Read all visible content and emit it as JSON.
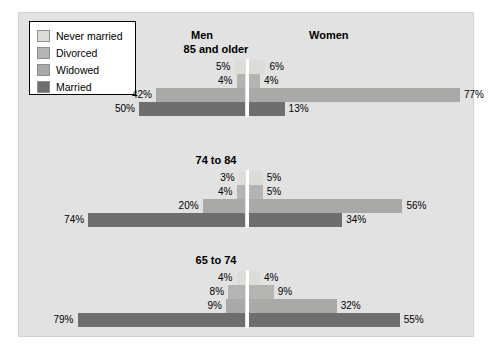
{
  "chart_data": {
    "type": "bar",
    "subtype": "diverging-horizontal-population-pyramid",
    "title": "",
    "xlabel": "",
    "ylabel": "",
    "grid": false,
    "legend_position": "top-left",
    "columns": [
      "Men",
      "Women"
    ],
    "series": [
      {
        "name": "Never married",
        "color": "#dcdcd8"
      },
      {
        "name": "Divorced",
        "color": "#b4b4b2"
      },
      {
        "name": "Widowed",
        "color": "#a9a9a7"
      },
      {
        "name": "Married",
        "color": "#6e6e6e"
      }
    ],
    "categories": [
      "85 and older",
      "74 to 84",
      "65 to 74"
    ],
    "groups": [
      {
        "label": "85 and older",
        "rows": [
          {
            "status": "Never married",
            "men": 5,
            "women": 6,
            "men_label": "5%",
            "women_label": "6%"
          },
          {
            "status": "Divorced",
            "men": 4,
            "women": 4,
            "men_label": "4%",
            "women_label": "4%"
          },
          {
            "status": "Widowed",
            "men": 42,
            "women": 77,
            "men_label": "42%",
            "women_label": "77%"
          },
          {
            "status": "Married",
            "men": 50,
            "women": 13,
            "men_label": "50%",
            "women_label": "13%"
          }
        ]
      },
      {
        "label": "74 to 84",
        "rows": [
          {
            "status": "Never married",
            "men": 3,
            "women": 5,
            "men_label": "3%",
            "women_label": "5%"
          },
          {
            "status": "Divorced",
            "men": 4,
            "women": 5,
            "men_label": "4%",
            "women_label": "5%"
          },
          {
            "status": "Widowed",
            "men": 20,
            "women": 56,
            "men_label": "20%",
            "women_label": "56%"
          },
          {
            "status": "Married",
            "men": 74,
            "women": 34,
            "men_label": "74%",
            "women_label": "34%"
          }
        ]
      },
      {
        "label": "65 to 74",
        "rows": [
          {
            "status": "Never married",
            "men": 4,
            "women": 4,
            "men_label": "4%",
            "women_label": "4%"
          },
          {
            "status": "Divorced",
            "men": 8,
            "women": 9,
            "men_label": "8%",
            "women_label": "9%"
          },
          {
            "status": "Widowed",
            "men": 9,
            "women": 32,
            "men_label": "9%",
            "women_label": "32%"
          },
          {
            "status": "Married",
            "men": 79,
            "women": 55,
            "men_label": "79%",
            "women_label": "55%"
          }
        ]
      }
    ]
  },
  "legend": {
    "items": [
      {
        "label": "Never married",
        "color": "#dcdcd8"
      },
      {
        "label": "Divorced",
        "color": "#b4b4b2"
      },
      {
        "label": "Widowed",
        "color": "#a9a9a7"
      },
      {
        "label": "Married",
        "color": "#6e6e6e"
      }
    ]
  },
  "headers": {
    "men": "Men",
    "women": "Women"
  },
  "colors": {
    "background": "#e2e2e2",
    "page": "#ffffff",
    "axis": "#ffffff",
    "text": "#000000",
    "legend_border": "#000000"
  }
}
